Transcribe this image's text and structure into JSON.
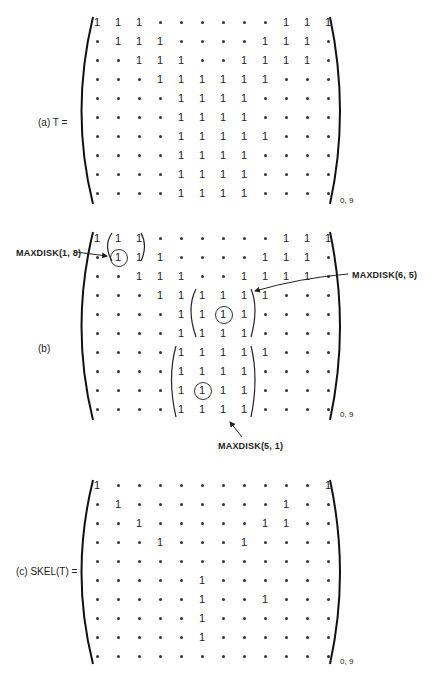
{
  "figures": [
    {
      "id": "a",
      "label": "(a)   T =",
      "subscript": "0, 9",
      "rows": [
        "111......111",
        ".111....111.",
        "..111..1111.",
        "...111111...",
        "....1111....",
        "....1111....",
        "....11111...",
        "....1111....",
        "....1111....",
        "....1111...."
      ]
    },
    {
      "id": "b",
      "label": "(b)",
      "subscript": "0, 9",
      "rows": [
        "111......111",
        ".111....111.",
        "..111..1111.",
        "...111111...",
        "....1111....",
        "....1111....",
        "....11111...",
        "....1111....",
        "....1111....",
        "....1111...."
      ],
      "circled": [
        [
          1,
          1
        ],
        [
          4,
          6
        ],
        [
          8,
          5
        ]
      ],
      "annotations": [
        {
          "text": "MAXDISK(1, 8)"
        },
        {
          "text": "MAXDISK(6, 5)"
        },
        {
          "text": "MAXDISK(5, 1)"
        }
      ]
    },
    {
      "id": "c",
      "label": "(c)   SKEL(T) =",
      "subscript": "0, 9",
      "rows": [
        "1..........1",
        ".1.......1..",
        "..1.....11..",
        "...1...1....",
        "............",
        ".....1......",
        ".....1..1...",
        ".....1......",
        ".....1......",
        "............"
      ]
    }
  ]
}
